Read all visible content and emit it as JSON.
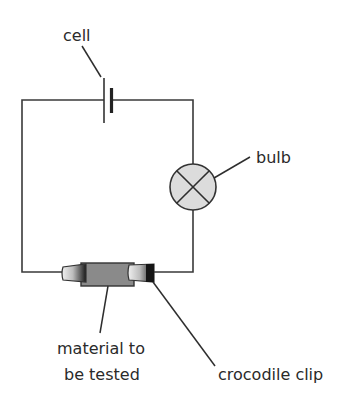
{
  "diagram": {
    "type": "circuit",
    "labels": {
      "cell": "cell",
      "bulb": "bulb",
      "material_line1": "material to",
      "material_line2": "be tested",
      "crocodile_clip": "crocodile clip"
    },
    "components": [
      {
        "name": "cell",
        "symbol": "cell-icon"
      },
      {
        "name": "bulb",
        "symbol": "lamp-icon"
      },
      {
        "name": "material to be tested",
        "symbol": "resistor-block"
      },
      {
        "name": "crocodile clip",
        "symbol": "crocodile-clip-icon",
        "count": 2
      }
    ],
    "colors": {
      "wire": "#3a3a3a",
      "bulb_fill": "#dcdcdc",
      "material_fill": "#8a8a8a",
      "clip_dark": "#1e1e1e",
      "clip_light": "#e8e8e8",
      "text": "#2a2a2a"
    }
  }
}
